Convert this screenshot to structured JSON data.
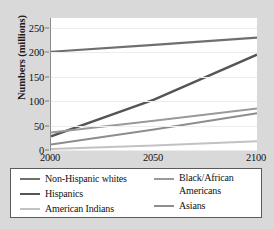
{
  "chart_data": {
    "type": "line",
    "title": "",
    "xlabel": "",
    "ylabel": "Numbers (millions)",
    "x": [
      2000,
      2050,
      2100
    ],
    "x_ticks": [
      "2000",
      "2050",
      "2100"
    ],
    "y_ticks": [
      "0",
      "50",
      "100",
      "150",
      "200",
      "250"
    ],
    "y_tick_values": [
      0,
      50,
      100,
      150,
      200,
      250
    ],
    "xlim": [
      2000,
      2100
    ],
    "ylim": [
      0,
      270
    ],
    "grid": "horizontal",
    "legend_position": "bottom",
    "series": [
      {
        "name": "Non-Hispanic whites",
        "color": "#6f6f6f",
        "width": 2.2,
        "x": [
          2000,
          2050,
          2100
        ],
        "values": [
          201,
          215,
          230
        ]
      },
      {
        "name": "Hispanics",
        "color": "#555555",
        "width": 2.4,
        "x": [
          2000,
          2050,
          2100
        ],
        "values": [
          28,
          103,
          195
        ]
      },
      {
        "name": "American Indians",
        "color": "#c2c2c2",
        "width": 2.0,
        "x": [
          2000,
          2050,
          2100
        ],
        "values": [
          2,
          9,
          18
        ]
      },
      {
        "name": "Black/African Americans",
        "color": "#9a9a9a",
        "width": 2.0,
        "x": [
          2000,
          2050,
          2100
        ],
        "values": [
          36,
          60,
          85
        ]
      },
      {
        "name": "Asians",
        "color": "#8d8d8d",
        "width": 2.0,
        "x": [
          2000,
          2050,
          2100
        ],
        "values": [
          11,
          42,
          75
        ]
      }
    ]
  },
  "axes": {
    "y_title": "Numbers (millions)",
    "y_ticks": [
      "250",
      "200",
      "150",
      "100",
      "50",
      "0"
    ],
    "x_ticks": [
      "2000",
      "2050",
      "2100"
    ]
  },
  "legend": {
    "left_column": [
      {
        "label": "Non-Hispanic whites",
        "color": "#6f6f6f"
      },
      {
        "label": "Hispanics",
        "color": "#555555"
      },
      {
        "label": "American Indians",
        "color": "#c2c2c2"
      }
    ],
    "right_column": [
      {
        "label": "Black/African Americans",
        "color": "#9a9a9a"
      },
      {
        "label": "Asians",
        "color": "#8d8d8d"
      }
    ]
  },
  "colors": {
    "figure_background": "#d9d9d9",
    "plot_background": "#ffffff",
    "gridline": "#ececec",
    "axis": "#8c8c8c",
    "legend_border": "#5a5a5a",
    "text": "#111111"
  }
}
